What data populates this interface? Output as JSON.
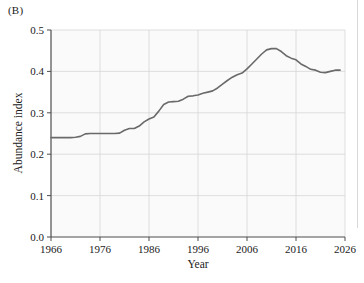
{
  "figure": {
    "panel_label": "(B)",
    "background_color": "#ffffff",
    "plot_background_color": "#fafafa",
    "line_color": "#6a6a6a",
    "grid_color": "#d5d5d5",
    "axis_color": "#4d4d4d"
  },
  "chart_data": {
    "type": "line",
    "title": "",
    "subtitle": "",
    "xlabel": "Year",
    "ylabel": "Abundance index",
    "xlim": [
      1966,
      2026
    ],
    "ylim": [
      0.0,
      0.5
    ],
    "xticks": [
      1966,
      1976,
      1986,
      1996,
      2006,
      2016,
      2026
    ],
    "xticklabels": [
      "1966",
      "1976",
      "1986",
      "1996",
      "2006",
      "2016",
      "2026"
    ],
    "yticks": [
      0.0,
      0.1,
      0.2,
      0.3,
      0.4,
      0.5
    ],
    "yticklabels": [
      "0.0",
      "0.1",
      "0.2",
      "0.3",
      "0.4",
      "0.5"
    ],
    "grid": true,
    "grid_axis": "both",
    "legend": null,
    "legend_position": "none",
    "annotations": [],
    "series": [
      {
        "name": "Abundance index",
        "color": "#6a6a6a",
        "x": [
          1966,
          1967,
          1968,
          1969,
          1970,
          1971,
          1972,
          1973,
          1974,
          1975,
          1976,
          1977,
          1978,
          1979,
          1980,
          1981,
          1982,
          1983,
          1984,
          1985,
          1986,
          1987,
          1988,
          1989,
          1990,
          1991,
          1992,
          1993,
          1994,
          1995,
          1996,
          1997,
          1998,
          1999,
          2000,
          2001,
          2002,
          2003,
          2004,
          2005,
          2006,
          2007,
          2008,
          2009,
          2010,
          2011,
          2012,
          2013,
          2014,
          2015,
          2016,
          2017,
          2018,
          2019,
          2020,
          2021,
          2022,
          2023,
          2024,
          2025
        ],
        "values": [
          0.24,
          0.24,
          0.24,
          0.24,
          0.24,
          0.241,
          0.243,
          0.249,
          0.25,
          0.25,
          0.25,
          0.25,
          0.25,
          0.25,
          0.251,
          0.258,
          0.262,
          0.262,
          0.268,
          0.278,
          0.285,
          0.29,
          0.304,
          0.32,
          0.326,
          0.327,
          0.328,
          0.333,
          0.34,
          0.341,
          0.343,
          0.347,
          0.35,
          0.353,
          0.36,
          0.369,
          0.378,
          0.386,
          0.392,
          0.396,
          0.406,
          0.418,
          0.43,
          0.442,
          0.452,
          0.455,
          0.455,
          0.448,
          0.438,
          0.432,
          0.428,
          0.418,
          0.412,
          0.405,
          0.403,
          0.398,
          0.397,
          0.4,
          0.403,
          0.403
        ]
      }
    ]
  }
}
